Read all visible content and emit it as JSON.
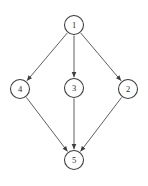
{
  "diagram": {
    "type": "directed-graph",
    "background_color": "#ffffff",
    "node_stroke_color": "#3a3a3a",
    "node_fill_color": "#ffffff",
    "edge_color": "#565656",
    "label_color": "#2b2b2b",
    "node_radius": 9.5,
    "nodes": [
      {
        "id": "1",
        "label": "1",
        "x": 74,
        "y": 25
      },
      {
        "id": "4",
        "label": "4",
        "x": 20,
        "y": 89
      },
      {
        "id": "3",
        "label": "3",
        "x": 74,
        "y": 88
      },
      {
        "id": "2",
        "label": "2",
        "x": 128,
        "y": 89
      },
      {
        "id": "5",
        "label": "5",
        "x": 74,
        "y": 160
      }
    ],
    "edges": [
      {
        "from": "1",
        "to": "4",
        "directed": true
      },
      {
        "from": "1",
        "to": "3",
        "directed": true
      },
      {
        "from": "1",
        "to": "2",
        "directed": true
      },
      {
        "from": "4",
        "to": "5",
        "directed": true
      },
      {
        "from": "3",
        "to": "5",
        "directed": true
      },
      {
        "from": "2",
        "to": "5",
        "directed": true
      }
    ]
  }
}
